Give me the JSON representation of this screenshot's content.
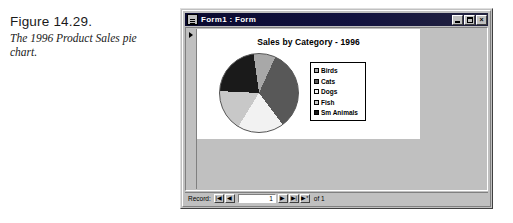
{
  "figure": {
    "number": "Figure 14.29.",
    "description": "The 1996 Product Sales pie chart."
  },
  "window": {
    "title": "Form1 : Form",
    "sysmenu_icon": "system-menu-icon",
    "buttons": {
      "minimize": "minimize-icon",
      "maximize": "maximize-icon",
      "close": "×"
    }
  },
  "form": {
    "record_selector_icon": "record-selector-arrow"
  },
  "navigator": {
    "label": "Record:",
    "first": "|◀",
    "previous": "◀",
    "value": "1",
    "next": "▶",
    "last": "▶|",
    "new": "▶*",
    "of_text": "of 1"
  },
  "chart_data": {
    "type": "pie",
    "title": "Sales by Category - 1996",
    "xlabel": "",
    "ylabel": "",
    "categories": [
      "Birds",
      "Cats",
      "Dogs",
      "Fish",
      "Sm Animals"
    ],
    "values": [
      9,
      33,
      19,
      17,
      22
    ],
    "colors": [
      "#a8a8a8",
      "#585858",
      "#f2f2f2",
      "#c8c8c8",
      "#1a1a1a"
    ],
    "legend_position": "right",
    "grid": false,
    "legend": [
      {
        "label": "Birds",
        "color": "#a8a8a8"
      },
      {
        "label": "Cats",
        "color": "#585858"
      },
      {
        "label": "Dogs",
        "color": "#f2f2f2"
      },
      {
        "label": "Fish",
        "color": "#c8c8c8"
      },
      {
        "label": "Sm Animals",
        "color": "#1a1a1a"
      }
    ]
  }
}
